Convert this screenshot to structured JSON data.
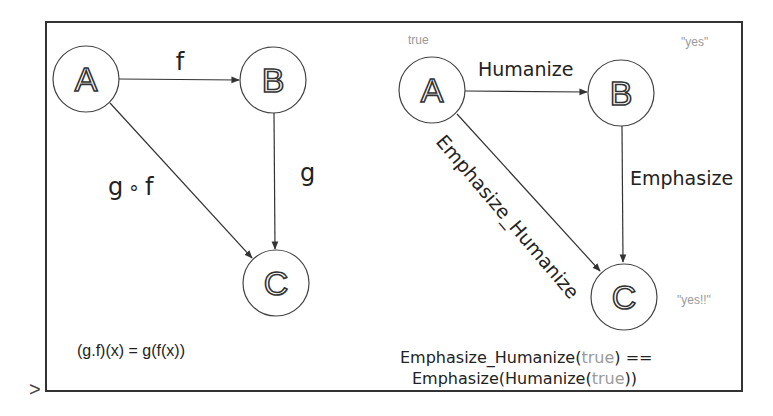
{
  "left_diagram": {
    "nodes": {
      "a": "A",
      "b": "B",
      "c": "C"
    },
    "edges": {
      "a_to_b": "f",
      "b_to_c": "g",
      "a_to_c": {
        "g": "g",
        "compose": "∘",
        "f": "f"
      }
    },
    "formula": "(g.f)(x) = g(f(x))"
  },
  "right_diagram": {
    "nodes": {
      "a": "A",
      "b": "B",
      "c": "C"
    },
    "node_values": {
      "a": "true",
      "b": "\"yes\"",
      "c": "\"yes!!\""
    },
    "edges": {
      "a_to_b": "Humanize",
      "b_to_c": "Emphasize",
      "a_to_c": "Emphasize_Humanize"
    },
    "formula": {
      "line1_prefix": "Emphasize_Humanize(",
      "line1_arg": "true",
      "line1_suffix": ") ==",
      "line2_prefix": "Emphasize(Humanize(",
      "line2_arg": "true",
      "line2_suffix": "))"
    }
  },
  "prompt_marker": ">",
  "colors": {
    "stroke": "#333333",
    "muted": "#9a9a9a",
    "background": "#ffffff"
  }
}
